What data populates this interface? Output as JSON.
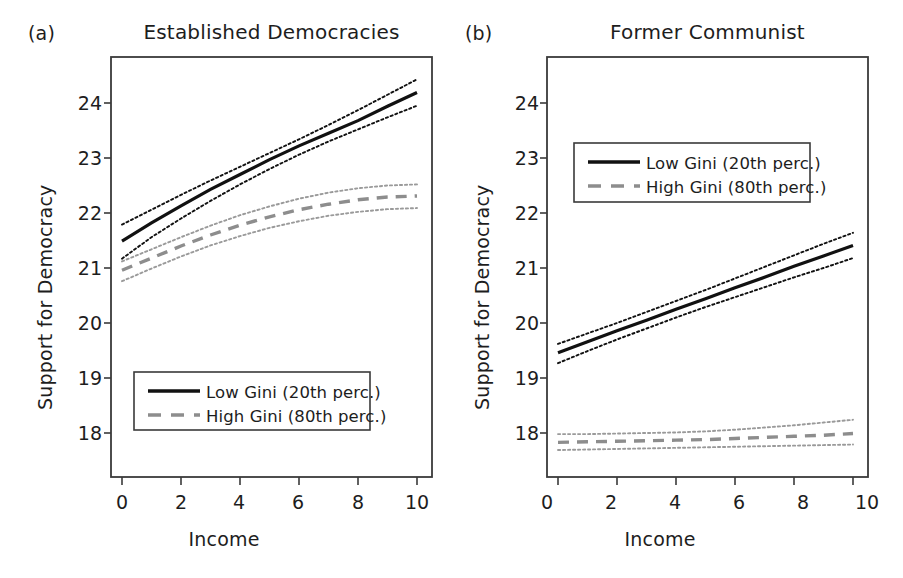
{
  "figure": {
    "panels": [
      {
        "key": "a",
        "label": "(a)",
        "title": "Established Democracies",
        "xlabel": "Income",
        "ylabel": "Support for Democracy"
      },
      {
        "key": "b",
        "label": "(b)",
        "title": "Former Communist",
        "xlabel": "Income",
        "ylabel": "Support for Democracy"
      }
    ],
    "legend": {
      "entries": [
        {
          "label": "Low Gini (20th perc.)",
          "style": "solid",
          "color": "#111111"
        },
        {
          "label": "High Gini (80th perc.)",
          "style": "dashed",
          "color": "#8d8d8d"
        }
      ]
    },
    "colors": {
      "axis": "#3a3a3a",
      "low_gini": "#111111",
      "high_gini": "#8d8d8d",
      "ci_low": "#111111",
      "ci_high": "#9a9a9a",
      "background": "#ffffff"
    }
  },
  "chart_data": [
    {
      "type": "line",
      "panel": "a",
      "title": "Established Democracies",
      "xlabel": "Income",
      "ylabel": "Support for Democracy",
      "xlim": [
        -0.42,
        10.7
      ],
      "ylim": [
        17.37,
        24.72
      ],
      "xticks": [
        0,
        2,
        4,
        6,
        8,
        10
      ],
      "yticks": [
        18,
        19,
        20,
        21,
        22,
        23,
        24
      ],
      "xtick_labels": [
        "0",
        "2",
        "4",
        "6",
        "8",
        "10"
      ],
      "ytick_labels": [
        "18",
        "19",
        "20",
        "21",
        "22",
        "23",
        "24"
      ],
      "grid": false,
      "legend_position": "bottom-center",
      "x": [
        0,
        1,
        2,
        3,
        4,
        5,
        6,
        7,
        8,
        9,
        10
      ],
      "series": [
        {
          "name": "Low Gini (20th perc.)",
          "style": "solid",
          "values": [
            21.49,
            21.82,
            22.13,
            22.43,
            22.7,
            22.97,
            23.22,
            23.45,
            23.68,
            23.94,
            24.19
          ],
          "ci_upper": [
            21.79,
            22.06,
            22.33,
            22.59,
            22.84,
            23.09,
            23.34,
            23.6,
            23.87,
            24.15,
            24.43
          ],
          "ci_lower": [
            21.17,
            21.56,
            21.9,
            22.22,
            22.52,
            22.8,
            23.06,
            23.3,
            23.52,
            23.74,
            23.95
          ]
        },
        {
          "name": "High Gini (80th perc.)",
          "style": "dashed",
          "values": [
            20.96,
            21.18,
            21.4,
            21.6,
            21.78,
            21.93,
            22.06,
            22.16,
            22.24,
            22.29,
            22.31
          ],
          "ci_upper": [
            21.12,
            21.34,
            21.56,
            21.77,
            21.96,
            22.12,
            22.26,
            22.37,
            22.45,
            22.5,
            22.52
          ],
          "ci_lower": [
            20.76,
            20.99,
            21.21,
            21.41,
            21.58,
            21.73,
            21.85,
            21.95,
            22.02,
            22.07,
            22.09
          ]
        }
      ]
    },
    {
      "type": "line",
      "panel": "b",
      "title": "Former Communist",
      "xlabel": "Income",
      "ylabel": "Support for Democracy",
      "xlim": [
        -0.42,
        10.7
      ],
      "ylim": [
        17.37,
        24.72
      ],
      "xticks": [
        0,
        2,
        4,
        6,
        8,
        10
      ],
      "yticks": [
        18,
        19,
        20,
        21,
        22,
        23,
        24
      ],
      "xtick_labels": [
        "0",
        "2",
        "4",
        "6",
        "8",
        "10"
      ],
      "ytick_labels": [
        "18",
        "19",
        "20",
        "21",
        "22",
        "23",
        "24"
      ],
      "grid": false,
      "legend_position": "upper-left",
      "x": [
        0,
        1,
        2,
        3,
        4,
        5,
        6,
        7,
        8,
        9,
        10
      ],
      "series": [
        {
          "name": "Low Gini (20th perc.)",
          "style": "solid",
          "values": [
            19.46,
            19.66,
            19.86,
            20.05,
            20.25,
            20.44,
            20.64,
            20.83,
            21.03,
            21.22,
            21.41
          ],
          "ci_upper": [
            19.62,
            19.81,
            20.0,
            20.2,
            20.4,
            20.6,
            20.81,
            21.02,
            21.23,
            21.44,
            21.64
          ],
          "ci_lower": [
            19.27,
            19.49,
            19.7,
            19.9,
            20.1,
            20.29,
            20.47,
            20.65,
            20.83,
            21.0,
            21.18
          ]
        },
        {
          "name": "High Gini (80th perc.)",
          "style": "dashed",
          "values": [
            17.83,
            17.84,
            17.85,
            17.86,
            17.87,
            17.88,
            17.9,
            17.92,
            17.94,
            17.96,
            17.99
          ],
          "ci_upper": [
            17.98,
            17.98,
            17.99,
            18.0,
            18.01,
            18.03,
            18.06,
            18.1,
            18.14,
            18.19,
            18.24
          ],
          "ci_lower": [
            17.69,
            17.7,
            17.71,
            17.72,
            17.73,
            17.74,
            17.75,
            17.76,
            17.77,
            17.78,
            17.79
          ]
        }
      ]
    }
  ]
}
